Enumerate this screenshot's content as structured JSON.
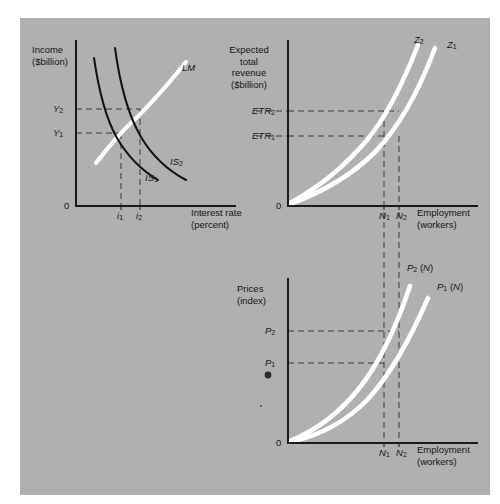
{
  "figure": {
    "background": "#ffffff",
    "plate_color": "#b0b0b0",
    "axis_color": "#1a1a1a",
    "dash_color": "#3a3a3a",
    "white_curve": "#ffffff",
    "black_curve": "#111111"
  },
  "panels": [
    {
      "id": "islm",
      "name": "IS-LM income and interest rate panel",
      "y_axis_label": "Income\n($billion)",
      "x_axis_label": "Interest rate\n(percent)",
      "origin_label": "0",
      "y_ticks": [
        {
          "label": "Y",
          "sub": "2"
        },
        {
          "label": "Y",
          "sub": "1"
        }
      ],
      "x_ticks": [
        {
          "label": "i",
          "sub": "1"
        },
        {
          "label": "i",
          "sub": "2"
        }
      ],
      "curves": [
        {
          "label": "LM",
          "sub": "",
          "color": "white",
          "slope": "upward"
        },
        {
          "label": "IS",
          "sub": "2",
          "color": "black",
          "slope": "downward"
        },
        {
          "label": "IS",
          "sub": "1",
          "color": "black",
          "slope": "downward"
        }
      ]
    },
    {
      "id": "etr",
      "name": "Expected total revenue panel",
      "y_axis_label": "Expected\ntotal\nrevenue\n($billion)",
      "x_axis_label": "Employment\n(workers)",
      "origin_label": "0",
      "y_ticks": [
        {
          "label": "ETR",
          "sub": "2"
        },
        {
          "label": "ETR",
          "sub": "1"
        }
      ],
      "x_ticks": [
        {
          "label": "N",
          "sub": "1"
        },
        {
          "label": "N",
          "sub": "2"
        }
      ],
      "curves": [
        {
          "label": "Z",
          "sub": "2",
          "color": "white",
          "slope": "upward"
        },
        {
          "label": "Z",
          "sub": "1",
          "color": "white",
          "slope": "upward"
        }
      ]
    },
    {
      "id": "prices",
      "name": "Prices index panel",
      "y_axis_label": "Prices\n(index)",
      "x_axis_label": "Employment\n(workers)",
      "origin_label": "0",
      "y_ticks": [
        {
          "label": "P",
          "sub": "2"
        },
        {
          "label": "P",
          "sub": "1"
        }
      ],
      "x_ticks": [
        {
          "label": "N",
          "sub": "1"
        },
        {
          "label": "N",
          "sub": "2"
        }
      ],
      "curves": [
        {
          "label": "P",
          "sub": "2",
          "suffix": "(N)",
          "color": "white",
          "slope": "upward"
        },
        {
          "label": "P",
          "sub": "1",
          "suffix": "(N)",
          "color": "white",
          "slope": "upward"
        }
      ]
    }
  ]
}
